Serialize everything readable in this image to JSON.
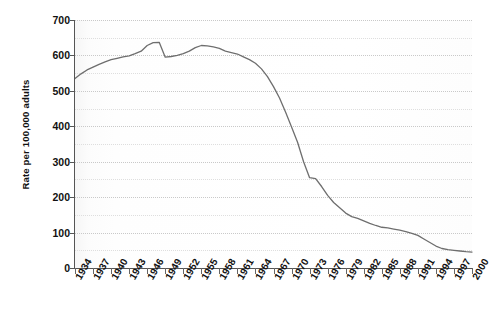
{
  "chart_data": {
    "type": "line",
    "title": "",
    "xlabel": "",
    "ylabel": "Rate per 100,000 adults",
    "xlim": [
      1934,
      2000
    ],
    "ylim": [
      0,
      700
    ],
    "y_ticks": [
      0,
      100,
      200,
      300,
      400,
      500,
      600,
      700
    ],
    "y_minor_ticks": [
      50,
      150,
      250,
      350,
      450,
      550,
      650
    ],
    "x_ticks": [
      1934,
      1937,
      1940,
      1943,
      1946,
      1949,
      1952,
      1955,
      1958,
      1961,
      1964,
      1967,
      1970,
      1973,
      1976,
      1979,
      1982,
      1985,
      1988,
      1991,
      1994,
      1997,
      2000
    ],
    "x_tick_labels": [
      "1934",
      "1937",
      "1940",
      "1943",
      "1946",
      "1949",
      "1952",
      "1955",
      "1958",
      "1961",
      "1964",
      "1967",
      "1970",
      "1973",
      "1976",
      "1979",
      "1982",
      "1985",
      "1988",
      "1991",
      "1994",
      "1997",
      "2000"
    ],
    "grid": true,
    "grid_style": "dotted-horizontal",
    "legend": "none",
    "line_color": "#6e6e6e",
    "line_width": 1.3,
    "x": [
      1934,
      1935,
      1936,
      1937,
      1938,
      1939,
      1940,
      1941,
      1942,
      1943,
      1944,
      1945,
      1946,
      1947,
      1948,
      1949,
      1950,
      1951,
      1952,
      1953,
      1954,
      1955,
      1956,
      1957,
      1958,
      1959,
      1960,
      1961,
      1962,
      1963,
      1964,
      1965,
      1966,
      1967,
      1968,
      1969,
      1970,
      1971,
      1972,
      1973,
      1974,
      1975,
      1976,
      1977,
      1978,
      1979,
      1980,
      1981,
      1982,
      1983,
      1984,
      1985,
      1986,
      1987,
      1988,
      1989,
      1990,
      1991,
      1992,
      1993,
      1994,
      1995,
      1996,
      1997,
      1998,
      1999,
      2000
    ],
    "values": [
      535,
      548,
      559,
      567,
      575,
      582,
      588,
      592,
      596,
      599,
      605,
      612,
      628,
      636,
      637,
      595,
      597,
      600,
      605,
      612,
      622,
      628,
      627,
      624,
      620,
      612,
      608,
      604,
      596,
      588,
      578,
      562,
      540,
      512,
      480,
      440,
      398,
      355,
      300,
      255,
      252,
      230,
      205,
      185,
      170,
      155,
      145,
      140,
      133,
      126,
      120,
      115,
      113,
      110,
      107,
      103,
      98,
      92,
      82,
      72,
      62,
      55,
      52,
      50,
      48,
      46,
      45
    ],
    "series_name": "Rate per 100,000 adults",
    "annotations": [
      {
        "x": 1948,
        "y": 637,
        "note": "peak before sharp drop"
      },
      {
        "x": 1949,
        "y": 595,
        "note": "abrupt drop"
      },
      {
        "x": 1955,
        "y": 628,
        "note": "secondary peak"
      },
      {
        "x": 1971,
        "y": 255,
        "note": "brief plateau"
      },
      {
        "x": 2000,
        "y": 45,
        "note": "final value"
      }
    ]
  }
}
